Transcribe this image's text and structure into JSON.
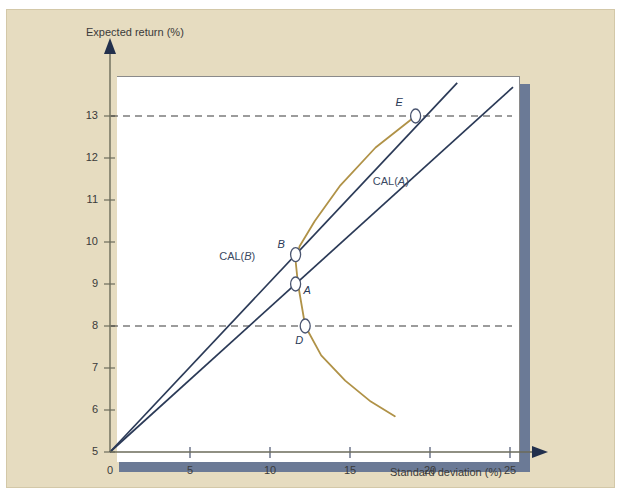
{
  "top_caption": "",
  "panel": {
    "background": "#e6dcc0",
    "plot_background": "#ffffff",
    "shadow_color": "#6b7a96"
  },
  "axes": {
    "y_title": "Expected return (%)",
    "x_title": "Standard deviation (%)",
    "y_ticks": [
      "5",
      "6",
      "7",
      "8",
      "9",
      "10",
      "11",
      "12",
      "13"
    ],
    "x_ticks": [
      "0",
      "5",
      "10",
      "15",
      "20",
      "25"
    ]
  },
  "chart_data": {
    "type": "line",
    "title": "",
    "xlabel": "Standard deviation (%)",
    "ylabel": "Expected return (%)",
    "xlim": [
      0,
      25.2
    ],
    "ylim": [
      4.6,
      14.2
    ],
    "grid": false,
    "legend": "inline-annotations",
    "risk_free_rate": 5,
    "series": [
      {
        "name": "CAL(A)",
        "type": "line",
        "color": "#2b3a57",
        "label": "CAL(A)",
        "label_x": 17.8,
        "label_y": 11.4,
        "slope": 0.345,
        "x": [
          0,
          25.2
        ],
        "y": [
          5.0,
          13.69
        ],
        "note": "Capital allocation line through portfolio A"
      },
      {
        "name": "CAL(B)",
        "type": "line",
        "color": "#2b3a57",
        "label": "CAL(B)",
        "label_x": 8.2,
        "label_y": 9.62,
        "slope": 0.405,
        "x": [
          0,
          21.7
        ],
        "y": [
          5.0,
          13.79
        ],
        "note": "Capital allocation line tangent to the frontier at B"
      },
      {
        "name": "Efficient frontier",
        "type": "curve",
        "color": "#b09247",
        "x": [
          19.1,
          16.6,
          14.4,
          12.8,
          11.85,
          11.6,
          11.75,
          12.2,
          13.2,
          14.7,
          16.3,
          17.8
        ],
        "y": [
          13.0,
          12.25,
          11.35,
          10.5,
          9.9,
          9.55,
          9.0,
          8.0,
          7.3,
          6.7,
          6.2,
          5.85
        ],
        "note": "Minimum-variance / portfolio opportunity set"
      }
    ],
    "points": [
      {
        "label": "A",
        "x": 11.6,
        "y": 9.0,
        "marker": "open-circle",
        "label_pos": "right"
      },
      {
        "label": "B",
        "x": 11.6,
        "y": 9.7,
        "marker": "open-circle",
        "label_pos": "left"
      },
      {
        "label": "D",
        "x": 12.2,
        "y": 8.0,
        "marker": "open-circle",
        "label_pos": "below"
      },
      {
        "label": "E",
        "x": 19.1,
        "y": 13.0,
        "marker": "open-circle",
        "label_pos": "above-left"
      }
    ],
    "reference_lines": [
      {
        "axis": "y",
        "value": 13,
        "style": "dashed",
        "color": "#3a3a3a"
      },
      {
        "axis": "y",
        "value": 8,
        "style": "dashed",
        "color": "#3a3a3a"
      }
    ]
  }
}
